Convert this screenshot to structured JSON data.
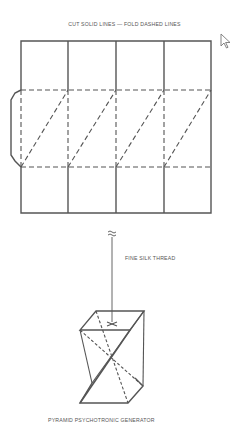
{
  "diagram": {
    "instruction_title": "CUT SOLID LINES — FOLD DASHED LINES",
    "thread_label": "FINE SILK THREAD",
    "caption": "PYRAMID PSYCHOTRONIC GENERATOR"
  },
  "pattern": {
    "columns": 4,
    "rows": 3,
    "column_x": [
      21,
      68,
      116,
      164,
      211
    ],
    "row_y": [
      41,
      90,
      167,
      213
    ],
    "tab": {
      "side": "left",
      "x": 11
    },
    "line_color": "#555555",
    "legend": {
      "solid": "cut",
      "dashed": "fold"
    }
  },
  "icons": {
    "cursor": "mouse-pointer-icon",
    "break_mark": "break-mark-icon",
    "pyramid": "pyramid-generator-icon"
  }
}
